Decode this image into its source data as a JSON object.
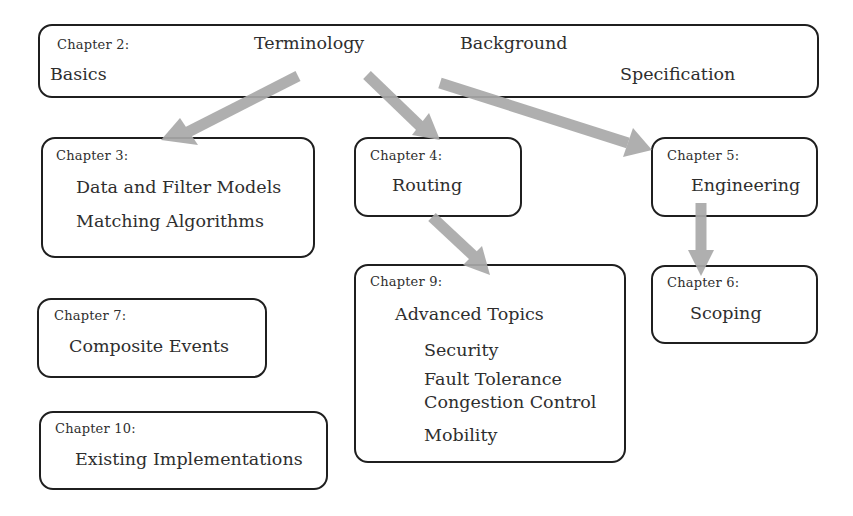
{
  "diagram": {
    "arrow_color": "#a9a9a9",
    "border_color": "#1f1f1f",
    "boxes": {
      "ch2": {
        "chapter": "Chapter 2:",
        "topics": [
          "Terminology",
          "Background",
          "Basics",
          "Specification"
        ]
      },
      "ch3": {
        "chapter": "Chapter 3:",
        "topics": [
          "Data and Filter Models",
          "Matching Algorithms"
        ]
      },
      "ch4": {
        "chapter": "Chapter 4:",
        "topics": [
          "Routing"
        ]
      },
      "ch5": {
        "chapter": "Chapter 5:",
        "topics": [
          "Engineering"
        ]
      },
      "ch6": {
        "chapter": "Chapter 6:",
        "topics": [
          "Scoping"
        ]
      },
      "ch7": {
        "chapter": "Chapter 7:",
        "topics": [
          "Composite Events"
        ]
      },
      "ch9": {
        "chapter": "Chapter 9:",
        "topics": [
          "Advanced Topics"
        ],
        "subtopics": [
          "Security",
          "Fault Tolerance",
          "Congestion Control",
          "Mobility"
        ]
      },
      "ch10": {
        "chapter": "Chapter 10:",
        "topics": [
          "Existing Implementations"
        ]
      }
    },
    "edges": [
      {
        "from": "Chapter 2",
        "to": "Chapter 3"
      },
      {
        "from": "Chapter 2",
        "to": "Chapter 4"
      },
      {
        "from": "Chapter 2",
        "to": "Chapter 5"
      },
      {
        "from": "Chapter 4",
        "to": "Chapter 9"
      },
      {
        "from": "Chapter 5",
        "to": "Chapter 6"
      }
    ]
  }
}
